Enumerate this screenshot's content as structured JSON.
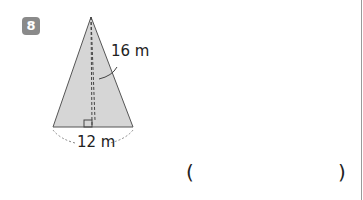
{
  "problem": {
    "number": "8",
    "slant_label": "16 m",
    "base_label": "12 m",
    "answer_open": "(",
    "answer_close": ")",
    "fill_color": "#d6d6d6"
  }
}
